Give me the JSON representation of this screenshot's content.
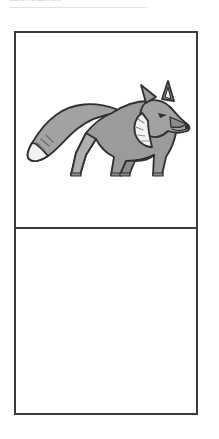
{
  "header": {
    "text": "cut-off header line",
    "rule_color": "#e2e2e6"
  },
  "puzzle": {
    "frame_border_color": "#3a3a3e",
    "background_color": "#ffffff",
    "top_panel": {
      "content_type": "image",
      "icon": "fox-icon",
      "description": "grayscale fox standing, facing right",
      "colors": {
        "body": "#9b9b9b",
        "body_light": "#b4b4b4",
        "body_dark": "#878787",
        "outline": "#2f2f33",
        "accent_white": "#f2f2f2"
      }
    },
    "bottom_panel": {
      "content_type": "text",
      "value": "?",
      "color": "#111114"
    }
  }
}
